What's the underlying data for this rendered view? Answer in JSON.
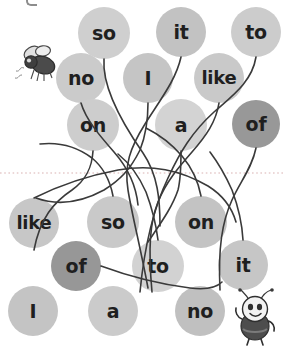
{
  "worksheet": {
    "title_fragment": "g",
    "divider_name": "dotted-fold-line",
    "background_color": "#ffffff",
    "line_color": "#3a3a3a",
    "text_color": "#1f1f1f",
    "dotted_line_color": "#e2c9c9"
  },
  "palette": {
    "light_gray": "#d2d2d2",
    "mid_gray": "#c0c0c0",
    "medium_gray": "#b4b4b4",
    "dark_gray": "#8f8f8f"
  },
  "bubbles": [
    {
      "id": "b1",
      "label": "so",
      "cx": 104,
      "cy": 33,
      "r": 26,
      "color": "#cfcfcf",
      "font_size": 19
    },
    {
      "id": "b2",
      "label": "it",
      "cx": 181,
      "cy": 32,
      "r": 25,
      "color": "#c2c2c2",
      "font_size": 19
    },
    {
      "id": "b3",
      "label": "to",
      "cx": 256,
      "cy": 32,
      "r": 25,
      "color": "#cccccc",
      "font_size": 19
    },
    {
      "id": "b4",
      "label": "no",
      "cx": 81,
      "cy": 78,
      "r": 25,
      "color": "#cbcbcb",
      "font_size": 19
    },
    {
      "id": "b5",
      "label": "I",
      "cx": 148,
      "cy": 78,
      "r": 25,
      "color": "#c5c5c5",
      "font_size": 19
    },
    {
      "id": "b6",
      "label": "like",
      "cx": 219,
      "cy": 78,
      "r": 25,
      "color": "#c9c9c9",
      "font_size": 18
    },
    {
      "id": "b7",
      "label": "on",
      "cx": 93,
      "cy": 125,
      "r": 26,
      "color": "#cdcdcd",
      "font_size": 19
    },
    {
      "id": "b8",
      "label": "a",
      "cx": 181,
      "cy": 125,
      "r": 26,
      "color": "#d3d3d3",
      "font_size": 19
    },
    {
      "id": "b9",
      "label": "of",
      "cx": 256,
      "cy": 124,
      "r": 24,
      "color": "#989898",
      "font_size": 19
    },
    {
      "id": "b10",
      "label": "like",
      "cx": 34,
      "cy": 223,
      "r": 25,
      "color": "#c7c7c7",
      "font_size": 18
    },
    {
      "id": "b11",
      "label": "so",
      "cx": 113,
      "cy": 222,
      "r": 26,
      "color": "#c9c9c9",
      "font_size": 19
    },
    {
      "id": "b12",
      "label": "on",
      "cx": 201,
      "cy": 222,
      "r": 26,
      "color": "#c3c3c3",
      "font_size": 19
    },
    {
      "id": "b13",
      "label": "of",
      "cx": 76,
      "cy": 266,
      "r": 25,
      "color": "#979797",
      "font_size": 19
    },
    {
      "id": "b14",
      "label": "to",
      "cx": 158,
      "cy": 266,
      "r": 26,
      "color": "#d2d2d2",
      "font_size": 19
    },
    {
      "id": "b15",
      "label": "it",
      "cx": 243,
      "cy": 265,
      "r": 25,
      "color": "#c6c6c6",
      "font_size": 19
    },
    {
      "id": "b16",
      "label": "I",
      "cx": 33,
      "cy": 311,
      "r": 25,
      "color": "#c4c4c4",
      "font_size": 19
    },
    {
      "id": "b17",
      "label": "a",
      "cx": 113,
      "cy": 311,
      "r": 25,
      "color": "#cbcbcb",
      "font_size": 19
    },
    {
      "id": "b18",
      "label": "no",
      "cx": 200,
      "cy": 311,
      "r": 25,
      "color": "#c0c0c0",
      "font_size": 19
    }
  ],
  "curves": [
    {
      "id": "c1",
      "d": "M 104 59 C 102 86, 120 120, 143 153 C 158 175, 160 200, 160 226"
    },
    {
      "id": "c2",
      "d": "M 181 57 C 176 80, 160 100, 145 124 C 130 148, 124 165, 128 190 C 132 215, 140 245, 148 288"
    },
    {
      "id": "c3",
      "d": "M 256 57 C 252 82, 232 96, 214 112 C 192 132, 180 152, 168 178 C 155 205, 145 240, 140 292"
    },
    {
      "id": "c4",
      "d": "M 81 103 C 86 120, 100 136, 114 152 C 128 168, 136 185, 138 205"
    },
    {
      "id": "c5",
      "d": "M 148 103 C 148 120, 146 135, 140 150 C 130 170, 120 180, 104 190 C 82 202, 58 206, 36 198"
    },
    {
      "id": "c6",
      "d": "M 219 103 C 216 122, 206 136, 192 152 C 178 168, 166 182, 158 202 C 150 222, 148 248, 152 292"
    },
    {
      "id": "c7",
      "d": "M 93 151 C 92 168, 86 180, 72 190 C 54 202, 40 218, 34 250"
    },
    {
      "id": "c8",
      "d": "M 181 151 C 181 166, 181 178, 178 190 C 172 208, 160 224, 148 242"
    },
    {
      "id": "c9",
      "d": "M 256 148 C 252 168, 240 182, 232 200 C 222 222, 218 248, 220 290"
    },
    {
      "id": "c10",
      "d": "M 34 198 C 58 186, 86 176, 118 170 C 152 164, 180 170, 208 186 C 224 196, 232 208, 236 222"
    },
    {
      "id": "c11",
      "d": "M 113 196 C 110 180, 104 168, 92 158 C 76 146, 58 142, 40 144"
    },
    {
      "id": "c12",
      "d": "M 201 196 C 198 180, 192 168, 182 156 C 170 142, 158 134, 146 128"
    },
    {
      "id": "c13",
      "d": "M 101 266 C 128 276, 158 284, 190 288 C 206 290, 216 288, 222 282"
    },
    {
      "id": "c14",
      "d": "M 158 240 C 156 224, 152 208, 146 192 C 138 174, 128 162, 118 154"
    },
    {
      "id": "c15",
      "d": "M 243 240 C 242 222, 238 206, 232 190 C 224 172, 216 160, 210 152"
    }
  ],
  "critters": [
    {
      "id": "fly",
      "name": "fly-illustration",
      "x": 12,
      "y": 42,
      "w": 50,
      "h": 46
    },
    {
      "id": "bug",
      "name": "bee-character-illustration",
      "x": 230,
      "y": 288,
      "w": 52,
      "h": 58
    }
  ]
}
